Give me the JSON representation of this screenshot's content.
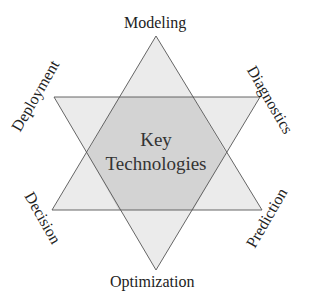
{
  "diagram": {
    "type": "hexagram",
    "center": {
      "line1": "Key",
      "line2": "Technologies"
    },
    "vertices": [
      {
        "position": "top",
        "label": "Modeling"
      },
      {
        "position": "upper-right",
        "label": "Diagnostics"
      },
      {
        "position": "lower-right",
        "label": "Prediction"
      },
      {
        "position": "bottom",
        "label": "Optimization"
      },
      {
        "position": "lower-left",
        "label": "Decision"
      },
      {
        "position": "upper-left",
        "label": "Deployment"
      }
    ],
    "colors": {
      "triangle_fill": "#ebebeb",
      "overlap_fill": "#d4d4d4",
      "stroke": "#555555",
      "text": "#222222"
    }
  }
}
